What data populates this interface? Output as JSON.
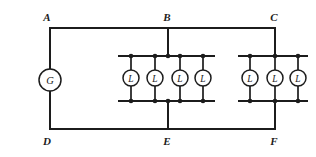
{
  "figure": {
    "kind": "electrical-circuit-schematic",
    "background_color": "#ffffff",
    "line_color": "#1c1c1c",
    "width": 316,
    "height": 157
  },
  "nodes": [
    {
      "id": "A",
      "label": "A",
      "x": 50,
      "y": 28,
      "label_x": 47,
      "label_y": 20,
      "corner": "top-left"
    },
    {
      "id": "B",
      "label": "B",
      "x": 168,
      "y": 28,
      "label_x": 167,
      "label_y": 20,
      "corner": "top-mid"
    },
    {
      "id": "C",
      "label": "C",
      "x": 275,
      "y": 28,
      "label_x": 274,
      "label_y": 20,
      "corner": "top-right"
    },
    {
      "id": "D",
      "label": "D",
      "x": 50,
      "y": 129,
      "label_x": 47,
      "label_y": 142,
      "corner": "bottom-left"
    },
    {
      "id": "E",
      "label": "E",
      "x": 168,
      "y": 129,
      "label_x": 167,
      "label_y": 142,
      "corner": "bottom-mid"
    },
    {
      "id": "F",
      "label": "F",
      "x": 275,
      "y": 129,
      "label_x": 274,
      "label_y": 142,
      "corner": "bottom-right"
    }
  ],
  "meter": {
    "symbol": "G",
    "name": "galvanometer",
    "x": 50,
    "y": 80,
    "radius": 11
  },
  "lamp_banks": [
    {
      "name": "middle-bank",
      "top_rail_y": 56,
      "bottom_rail_y": 101,
      "rail_x_start": 118,
      "rail_x_end": 215,
      "feed_top_x": 168,
      "feed_bottom_x": 168,
      "lamps": [
        {
          "symbol": "L",
          "x": 131,
          "radius": 8
        },
        {
          "symbol": "L",
          "x": 155,
          "radius": 8
        },
        {
          "symbol": "L",
          "x": 180,
          "radius": 8
        },
        {
          "symbol": "L",
          "x": 203,
          "radius": 8
        }
      ]
    },
    {
      "name": "right-bank",
      "top_rail_y": 56,
      "bottom_rail_y": 101,
      "rail_x_start": 238,
      "rail_x_end": 308,
      "feed_top_x": 275,
      "feed_bottom_x": 275,
      "lamps": [
        {
          "symbol": "L",
          "x": 250,
          "radius": 8
        },
        {
          "symbol": "L",
          "x": 275,
          "radius": 8
        },
        {
          "symbol": "L",
          "x": 298,
          "radius": 8
        }
      ]
    }
  ],
  "wires": {
    "top_rail": {
      "x1": 50,
      "y1": 28,
      "x2": 275,
      "y2": 28
    },
    "bottom_rail": {
      "x1": 50,
      "y1": 129,
      "x2": 275,
      "y2": 129
    },
    "left_upper": {
      "x1": 50,
      "y1": 28,
      "x2": 50,
      "y2": 69
    },
    "left_lower": {
      "x1": 50,
      "y1": 91,
      "x2": 50,
      "y2": 129
    },
    "b_drop": {
      "x1": 168,
      "y1": 28,
      "x2": 168,
      "y2": 56
    },
    "e_rise": {
      "x1": 168,
      "y1": 101,
      "x2": 168,
      "y2": 129
    },
    "c_drop": {
      "x1": 275,
      "y1": 28,
      "x2": 275,
      "y2": 56
    },
    "f_rise": {
      "x1": 275,
      "y1": 101,
      "x2": 275,
      "y2": 129
    }
  }
}
